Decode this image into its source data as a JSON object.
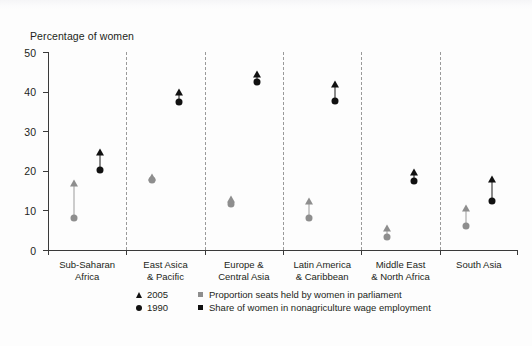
{
  "chart_data": {
    "type": "scatter",
    "title": "",
    "xlabel": "",
    "ylabel": "Percentage of women",
    "ylim": [
      0,
      50
    ],
    "yticks": [
      0,
      10,
      20,
      30,
      40,
      50
    ],
    "grid": false,
    "legend_position": "bottom",
    "categories": [
      "Sub-Saharan Africa",
      "East Asica & Pacific",
      "Europe & Central Asia",
      "Latin America & Caribbean",
      "Middle East & North Africa",
      "South Asia"
    ],
    "category_lines": [
      [
        "Sub-Saharan",
        "Africa"
      ],
      [
        "East Asica",
        "& Pacific"
      ],
      [
        "Europe &",
        "Central Asia"
      ],
      [
        "Latin America",
        "& Caribbean"
      ],
      [
        "Middle East",
        "& North Africa"
      ],
      [
        "South Asia"
      ]
    ],
    "marker_legend": [
      {
        "marker": "triangle-up",
        "label": "2005"
      },
      {
        "marker": "circle",
        "label": "1990"
      }
    ],
    "color_legend": [
      {
        "color": "#8e8e8e",
        "marker": "square",
        "label": "Proportion seats held by women in parliament"
      },
      {
        "color": "#111111",
        "marker": "square",
        "label": "Share of women in nonagriculture wage employment"
      }
    ],
    "series": [
      {
        "name": "Proportion seats held by women in parliament",
        "color": "#8e8e8e",
        "values_1990": [
          8.0,
          17.8,
          11.5,
          8.0,
          3.2,
          6.0
        ],
        "values_2005": [
          17.0,
          18.4,
          13.0,
          12.5,
          5.5,
          10.5
        ]
      },
      {
        "name": "Share of women in nonagriculture wage employment",
        "color": "#111111",
        "values_1990": [
          20.2,
          37.4,
          42.5,
          37.6,
          17.5,
          12.4
        ],
        "values_2005": [
          24.8,
          40.0,
          44.5,
          42.0,
          19.6,
          18.0
        ]
      }
    ]
  }
}
